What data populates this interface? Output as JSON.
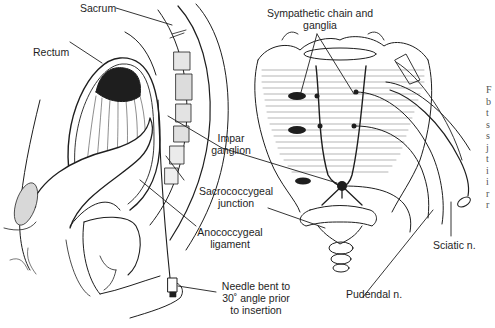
{
  "figure": {
    "labels": {
      "sacrum": "Sacrum",
      "rectum": "Rectum",
      "impar_ganglion_1": "Impar",
      "impar_ganglion_2": "ganglion",
      "sacrococcygeal_1": "Sacrococcygeal",
      "sacrococcygeal_2": "junction",
      "anococcygeal_1": "Anococcygeal",
      "anococcygeal_2": "ligament",
      "needle_1": "Needle bent to",
      "needle_2": "30˚ angle prior",
      "needle_3": "to insertion",
      "sympathetic_1": "Sympathetic chain and",
      "sympathetic_2": "ganglia",
      "sciatic": "Sciatic n.",
      "pudendal": "Pudendal n."
    },
    "caption_fragment": [
      "F",
      "b",
      "t",
      "s",
      "s",
      "j",
      "t",
      "i",
      "i",
      "r",
      "r"
    ]
  },
  "colors": {
    "ink": "#1e1e1e",
    "background": "#ffffff",
    "caption": "#555555"
  }
}
